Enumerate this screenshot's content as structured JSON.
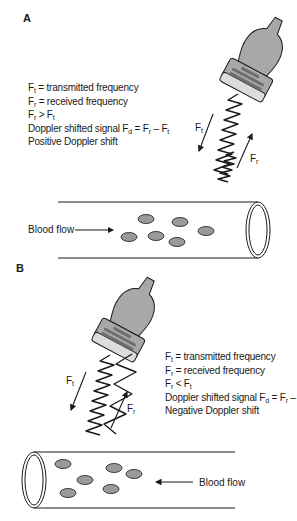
{
  "panels": [
    {
      "id": "A",
      "label": "A",
      "legend": {
        "line1": {
          "symbol": "F",
          "sub": "t",
          "text": " = transmitted frequency"
        },
        "line2": {
          "symbol": "F",
          "sub": "r",
          "text": " = received frequency"
        },
        "line3": {
          "a": "F",
          "a_sub": "r",
          "op": " > ",
          "b": "F",
          "b_sub": "t"
        },
        "line4": {
          "prefix": "Doppler shifted signal ",
          "lhs": "F",
          "lhs_sub": "d",
          "eq": " = ",
          "a": "F",
          "a_sub": "r",
          "minus": " – ",
          "b": "F",
          "b_sub": "t"
        },
        "line5": "Positive Doppler shift"
      },
      "wave_labels": {
        "transmitted": {
          "symbol": "F",
          "sub": "t"
        },
        "received": {
          "symbol": "F",
          "sub": "r"
        }
      },
      "flow_label": "Blood flow",
      "flow_direction": "toward transducer (left to right)",
      "received_wave": "compressed (higher frequency)"
    },
    {
      "id": "B",
      "label": "B",
      "legend": {
        "line1": {
          "symbol": "F",
          "sub": "t",
          "text": " = transmitted frequency"
        },
        "line2": {
          "symbol": "F",
          "sub": "r",
          "text": " = received frequency"
        },
        "line3": {
          "a": "F",
          "a_sub": "r",
          "op": " < ",
          "b": "F",
          "b_sub": "t"
        },
        "line4": {
          "prefix": "Doppler shifted signal ",
          "lhs": "F",
          "lhs_sub": "d",
          "eq": " = ",
          "a": "F",
          "a_sub": "r",
          "minus": " – ",
          "b": "F",
          "b_sub": "t"
        },
        "line5": "Negative Doppler shift"
      },
      "wave_labels": {
        "transmitted": {
          "symbol": "F",
          "sub": "t"
        },
        "received": {
          "symbol": "F",
          "sub": "r"
        }
      },
      "flow_label": "Blood flow",
      "flow_direction": "away from transducer (right to left)",
      "received_wave": "stretched (lower frequency)"
    }
  ],
  "colors": {
    "probe_fill": "#a8a8a8",
    "probe_face": "#dcdcdc",
    "probe_slots": "#6e6e6e",
    "cell_fill": "#9a9a9a",
    "line": "#1a1a1a"
  }
}
